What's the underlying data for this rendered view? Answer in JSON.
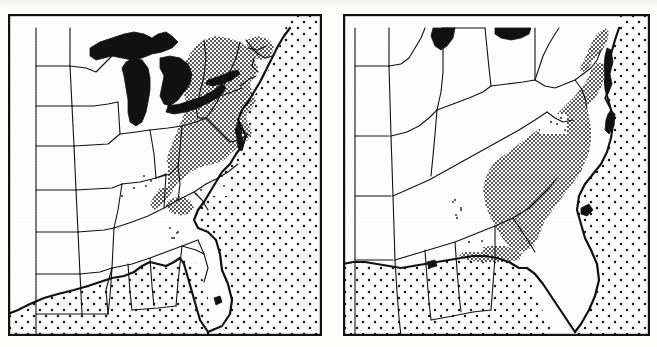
{
  "figure": {
    "kind": "two-panel-distribution-map",
    "background_color": "#fdfdfb",
    "ink_color": "#111111",
    "panel_count": 2
  },
  "legend_semantics": {
    "ocean_fill": "coarse-stipple",
    "species_range_fill": "dense-stipple",
    "lake_fill": "solid-black",
    "land_fill": "white",
    "border_stroke": "thin-black-line"
  },
  "panels": [
    {
      "id": "panel-left",
      "name": "left-distribution-map",
      "title": "",
      "frame": {
        "x": 8,
        "y": 14,
        "width": 314,
        "height": 322
      },
      "region": "eastern-united-states",
      "features": {
        "great_lakes_visible": true,
        "lakes": [
          "Lake Superior",
          "Lake Michigan",
          "Lake Huron",
          "Lake Erie",
          "Lake Ontario",
          "Lake Okeechobee"
        ],
        "ocean_stipple": true,
        "range_shading_present": true,
        "range_extent": "northeast-and-mid-atlantic-appalachian"
      }
    },
    {
      "id": "panel-right",
      "name": "right-distribution-map",
      "title": "",
      "frame": {
        "x": 343,
        "y": 14,
        "width": 307,
        "height": 322
      },
      "region": "southeastern-united-states",
      "features": {
        "great_lakes_visible": true,
        "lakes": [
          "Lake Michigan",
          "Lake Erie",
          "Lake Okeechobee"
        ],
        "ocean_stipple": true,
        "range_shading_present": true,
        "range_extent": "southeast-coastal-plain-and-florida"
      }
    }
  ],
  "chart_data": {
    "type": "map",
    "title": "",
    "subtitle": "",
    "xlabel": "",
    "ylabel": "",
    "panels": [
      {
        "label": "left",
        "shaded_range_states": [
          "New York",
          "Pennsylvania",
          "New Jersey",
          "Maryland",
          "Delaware",
          "West Virginia",
          "Virginia",
          "Connecticut",
          "Rhode Island",
          "Massachusetts",
          "Ohio (eastern)",
          "Kentucky (eastern)",
          "Tennessee (eastern)",
          "North Carolina (western)"
        ],
        "sparse_range_states": [
          "Kentucky",
          "Tennessee",
          "Georgia",
          "North Carolina"
        ],
        "unshaded_states": [
          "Minnesota",
          "Wisconsin",
          "Iowa",
          "Illinois",
          "Indiana",
          "Michigan",
          "Missouri",
          "Arkansas",
          "Louisiana",
          "Mississippi",
          "Alabama",
          "Florida",
          "South Carolina",
          "Kansas",
          "Nebraska",
          "South Dakota",
          "North Dakota",
          "Oklahoma",
          "Maine",
          "New Hampshire",
          "Vermont"
        ]
      },
      {
        "label": "right",
        "shaded_range_states": [
          "Florida (northern)",
          "Georgia (southern and eastern)",
          "South Carolina",
          "North Carolina (coastal)",
          "Virginia (coastal)"
        ],
        "sparse_range_states": [
          "Alabama",
          "North Carolina",
          "Louisiana"
        ],
        "unshaded_states": [
          "Illinois",
          "Indiana",
          "Ohio",
          "Kentucky",
          "Tennessee",
          "Missouri",
          "Arkansas",
          "Mississippi",
          "Louisiana",
          "Alabama",
          "West Virginia",
          "Virginia",
          "Iowa",
          "Kansas"
        ]
      }
    ]
  }
}
